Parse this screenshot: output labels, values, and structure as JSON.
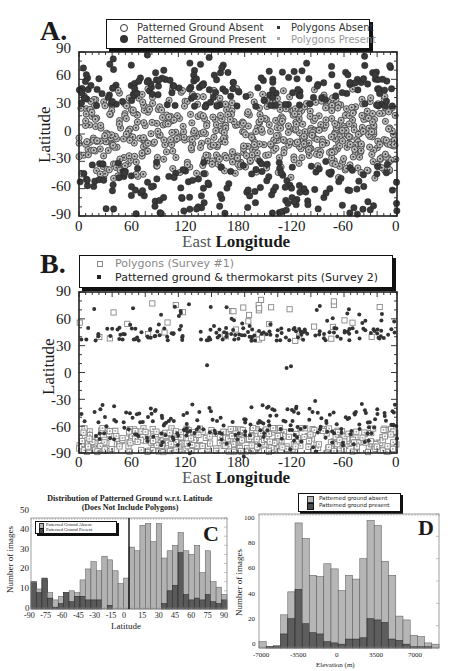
{
  "panels": {
    "A": {
      "letter": "A.",
      "legend": {
        "pg_absent": "Patterned Ground Absent",
        "pg_present": "Patterned Ground Present",
        "poly_absent": "Polygons Absent",
        "poly_present": "Polygons Present"
      },
      "xlabel_a": "East ",
      "xlabel_b": "Longitude",
      "ylabel": "Latitude",
      "xticks": [
        "0",
        "60",
        "120",
        "180",
        "-120",
        "-60",
        "0"
      ],
      "yticks": [
        "90",
        "60",
        "30",
        "0",
        "-30",
        "-60",
        "-90"
      ]
    },
    "B": {
      "letter": "B.",
      "legend": {
        "polygons": "Polygons (Survey #1)",
        "patterned": "Patterned ground & thermokarst pits (Survey 2)"
      },
      "xlabel_a": "East ",
      "xlabel_b": "Longitude",
      "ylabel": "Latitude",
      "xticks": [
        "0",
        "60",
        "120",
        "180",
        "-120",
        "-60",
        "0"
      ],
      "yticks": [
        "90",
        "60",
        "30",
        "0",
        "-30",
        "-60",
        "-90"
      ]
    },
    "C": {
      "letter": "C",
      "title_line1": "Distribution of Patterned Ground w.r.t. Latitude",
      "title_line2": "(Does Not Include Polygons)",
      "legend": {
        "absent": "Patterned Ground Absent",
        "present": "Patterned Ground Present"
      },
      "xlabel": "Latitude",
      "ylabel": "Number of images",
      "xticks": [
        "-90",
        "-75",
        "-60",
        "-45",
        "-30",
        "-15",
        "0",
        "15",
        "30",
        "45",
        "60",
        "75",
        "90"
      ],
      "yticks": [
        "50",
        "40",
        "30",
        "20",
        "10",
        "0"
      ]
    },
    "D": {
      "letter": "D",
      "legend": {
        "absent": "Patterned ground absent",
        "present": "Patterned ground present"
      },
      "xlabel": "Elevation (m)",
      "ylabel": "Number of images",
      "xticks": [
        "-7000",
        "-3500",
        "0",
        "3500",
        "7000"
      ],
      "yticks": [
        "100",
        "80",
        "60",
        "40",
        "20",
        "0"
      ]
    }
  },
  "chart_data": [
    {
      "type": "scatter",
      "panel": "A",
      "title": "",
      "xlabel": "East Longitude",
      "ylabel": "Latitude",
      "xlim": [
        0,
        360
      ],
      "ylim": [
        -90,
        90
      ],
      "x_tick_labels": [
        "0",
        "60",
        "120",
        "180",
        "-120",
        "-60",
        "0"
      ],
      "y_tick_labels": [
        "90",
        "60",
        "30",
        "0",
        "-30",
        "-60",
        "-90"
      ],
      "legend": [
        "Patterned Ground Absent",
        "Patterned Ground Present",
        "Polygons Absent",
        "Polygons Present"
      ],
      "legend_position": "top",
      "series": [
        {
          "name": "Patterned Ground Absent",
          "marker": "open-circle-with-dot",
          "description": "dense band between ~-40 and ~40 latitude across all longitudes",
          "lat_range": [
            -45,
            45
          ]
        },
        {
          "name": "Patterned Ground Present",
          "marker": "filled-circle",
          "description": "concentrated poleward of ~30 N and ~30 S, to the poles",
          "lat_range_north": [
            30,
            90
          ],
          "lat_range_south": [
            -90,
            -30
          ]
        }
      ]
    },
    {
      "type": "scatter",
      "panel": "B",
      "title": "",
      "xlabel": "East Longitude",
      "ylabel": "Latitude",
      "xlim": [
        0,
        360
      ],
      "ylim": [
        -90,
        90
      ],
      "x_tick_labels": [
        "0",
        "60",
        "120",
        "180",
        "-120",
        "-60",
        "0"
      ],
      "y_tick_labels": [
        "90",
        "60",
        "30",
        "0",
        "-30",
        "-60",
        "-90"
      ],
      "legend": [
        "Polygons (Survey #1)",
        "Patterned ground & thermokarst pits (Survey 2)"
      ],
      "legend_position": "top",
      "series": [
        {
          "name": "Polygons (Survey #1)",
          "marker": "open-square",
          "description": "dense band -60 to -90; sparse 35-80 N",
          "lat_range_south": [
            -90,
            -55
          ],
          "lat_range_north": [
            35,
            85
          ]
        },
        {
          "name": "Patterned ground & thermokarst pits (Survey 2)",
          "marker": "filled-dot",
          "description": "band 30-60 N plus scattered to 85 N; -30 to -90 S",
          "lat_range_north": [
            30,
            85
          ],
          "lat_range_south": [
            -90,
            -28
          ]
        }
      ]
    },
    {
      "type": "bar",
      "panel": "C",
      "title": "Distribution of Patterned Ground w.r.t. Latitude (Does Not Include Polygons)",
      "xlabel": "Latitude",
      "ylabel": "Number of images",
      "xlim": [
        -90,
        90
      ],
      "ylim": [
        0,
        50
      ],
      "grid": false,
      "legend_position": "upper-left",
      "bin_width": 5,
      "categories": [
        -87.5,
        -82.5,
        -77.5,
        -72.5,
        -67.5,
        -62.5,
        -57.5,
        -52.5,
        -47.5,
        -42.5,
        -37.5,
        -32.5,
        -27.5,
        -22.5,
        -17.5,
        -12.5,
        -7.5,
        -2.5,
        2.5,
        7.5,
        12.5,
        17.5,
        22.5,
        27.5,
        32.5,
        37.5,
        42.5,
        47.5,
        52.5,
        57.5,
        62.5,
        67.5,
        72.5,
        77.5,
        82.5,
        87.5
      ],
      "series": [
        {
          "name": "Patterned Ground Absent",
          "values": [
            14,
            11,
            16,
            9,
            5,
            7,
            9,
            10,
            9,
            16,
            22,
            26,
            21,
            29,
            27,
            21,
            14,
            17,
            34,
            32,
            46,
            47,
            37,
            47,
            28,
            32,
            35,
            42,
            32,
            30,
            35,
            20,
            32,
            15,
            12,
            8
          ]
        },
        {
          "name": "Patterned Ground Present",
          "values": [
            15,
            9,
            17,
            6,
            1,
            3,
            9,
            4,
            7,
            7,
            5,
            5,
            5,
            0,
            2,
            0,
            0,
            0,
            0,
            0,
            0,
            0,
            0,
            0,
            3,
            10,
            13,
            31,
            8,
            5,
            6,
            5,
            8,
            4,
            3,
            5
          ]
        }
      ]
    },
    {
      "type": "bar",
      "panel": "D",
      "title": "",
      "xlabel": "Elevation (m)",
      "ylabel": "Number of images",
      "xlim": [
        -8000,
        10000
      ],
      "ylim": [
        0,
        100
      ],
      "grid": false,
      "legend_position": "top",
      "bin_width": 700,
      "categories": [
        -7350,
        -6650,
        -5950,
        -5250,
        -4550,
        -3850,
        -3150,
        -2450,
        -1750,
        -1050,
        -350,
        350,
        1050,
        1750,
        2450,
        3150,
        3850,
        4550,
        5250,
        5950,
        6650,
        7350,
        8050,
        8750,
        9450
      ],
      "series": [
        {
          "name": "Patterned ground absent",
          "values": [
            5,
            1,
            2,
            26,
            44,
            98,
            86,
            57,
            56,
            66,
            62,
            45,
            57,
            54,
            70,
            100,
            96,
            68,
            57,
            25,
            22,
            10,
            9,
            4,
            3
          ]
        },
        {
          "name": "Patterned ground present",
          "values": [
            0,
            1,
            1,
            11,
            23,
            46,
            19,
            12,
            11,
            5,
            4,
            3,
            7,
            7,
            8,
            23,
            22,
            20,
            7,
            6,
            3,
            1,
            1,
            1,
            0
          ]
        }
      ]
    }
  ]
}
